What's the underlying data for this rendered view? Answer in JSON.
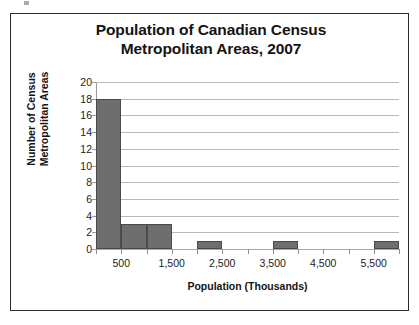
{
  "chart_data": {
    "type": "bar",
    "title": "Population of Canadian Census Metropolitan Areas, 2007",
    "title_lines": [
      "Population of Canadian Census",
      "Metropolitan Areas, 2007"
    ],
    "xlabel": "Population (Thousands)",
    "ylabel": "Number of Census Metropolitan Areas",
    "ylabel_lines": [
      "Number of Census",
      "Metropolitan Areas"
    ],
    "ylim": [
      0,
      20
    ],
    "ytick_values": [
      0,
      2,
      4,
      6,
      8,
      10,
      12,
      14,
      16,
      18,
      20
    ],
    "ytick_labels": [
      "0",
      "2",
      "4",
      "6",
      "8",
      "10",
      "12",
      "14",
      "16",
      "18",
      "20"
    ],
    "xlim": [
      0,
      6000
    ],
    "xtick_values": [
      500,
      1500,
      2500,
      3500,
      4500,
      5500
    ],
    "xtick_labels": [
      "500",
      "1,500",
      "2,500",
      "3,500",
      "4,500",
      "5,500"
    ],
    "bin_width": 500,
    "grid": "horizontal",
    "legend": "none",
    "bar_color": "#6e6e6e",
    "bar_edge_color": "#4a4a4a",
    "gridline_color": "#b9b9b9",
    "bins": [
      {
        "bin_start": 0,
        "bin_end": 500,
        "value": 18
      },
      {
        "bin_start": 500,
        "bin_end": 1000,
        "value": 3
      },
      {
        "bin_start": 1000,
        "bin_end": 1500,
        "value": 3
      },
      {
        "bin_start": 1500,
        "bin_end": 2000,
        "value": 0
      },
      {
        "bin_start": 2000,
        "bin_end": 2500,
        "value": 1
      },
      {
        "bin_start": 2500,
        "bin_end": 3000,
        "value": 0
      },
      {
        "bin_start": 3000,
        "bin_end": 3500,
        "value": 0
      },
      {
        "bin_start": 3500,
        "bin_end": 4000,
        "value": 1
      },
      {
        "bin_start": 4000,
        "bin_end": 4500,
        "value": 0
      },
      {
        "bin_start": 4500,
        "bin_end": 5000,
        "value": 0
      },
      {
        "bin_start": 5000,
        "bin_end": 5500,
        "value": 0
      },
      {
        "bin_start": 5500,
        "bin_end": 6000,
        "value": 1
      }
    ],
    "categories": [
      "0-500",
      "500-1000",
      "1000-1500",
      "1500-2000",
      "2000-2500",
      "2500-3000",
      "3000-3500",
      "3500-4000",
      "4000-4500",
      "4500-5000",
      "5000-5500",
      "5500-6000"
    ],
    "values": [
      18,
      3,
      3,
      0,
      1,
      0,
      0,
      1,
      0,
      0,
      0,
      1
    ]
  }
}
